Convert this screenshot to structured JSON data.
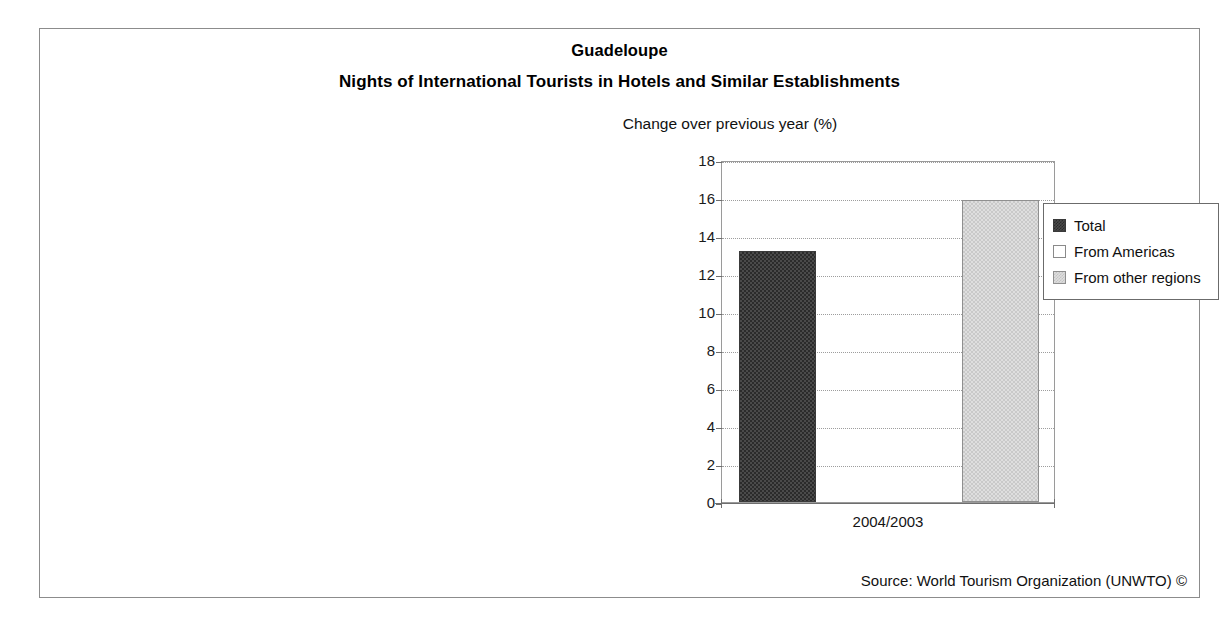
{
  "figure": {
    "title": "Guadeloupe",
    "subtitle": "Nights of International Tourists in Hotels and Similar Establishments",
    "axis_note": "Change over previous year (%)",
    "source": "Source: World Tourism Organization (UNWTO) ©"
  },
  "chart_data": {
    "type": "bar",
    "title": "Nights of International Tourists in Hotels and Similar Establishments",
    "subtitle": "Guadeloupe",
    "xlabel": "",
    "ylabel": "Change over previous year (%)",
    "categories": [
      "2004/2003"
    ],
    "series": [
      {
        "name": "Total",
        "values": [
          13.2
        ],
        "color": "#4a4a4a"
      },
      {
        "name": "From Americas",
        "values": [
          0.0
        ],
        "color": "#ffffff"
      },
      {
        "name": "From other regions",
        "values": [
          15.9
        ],
        "color": "#dedede"
      }
    ],
    "ylim": [
      0,
      18
    ],
    "yticks": [
      0,
      2,
      4,
      6,
      8,
      10,
      12,
      14,
      16,
      18
    ],
    "ytick_labels": [
      "0",
      "2",
      "4",
      "6",
      "8",
      "10",
      "12",
      "14",
      "16",
      "18"
    ],
    "grid": true,
    "grid_axis": "y",
    "legend_position": "top-right-outside"
  },
  "legend": {
    "items": [
      {
        "label": "Total",
        "swatch": "total"
      },
      {
        "label": "From Americas",
        "swatch": "americas"
      },
      {
        "label": "From other regions",
        "swatch": "other"
      }
    ]
  },
  "colors": {
    "frame": "#8c8c8c",
    "gridline": "#9d9d9d",
    "axis": "#6e6e6e",
    "text": "#111111",
    "bar_total": "#4a4a4a",
    "bar_americas": "#ffffff",
    "bar_other": "#dedede"
  }
}
